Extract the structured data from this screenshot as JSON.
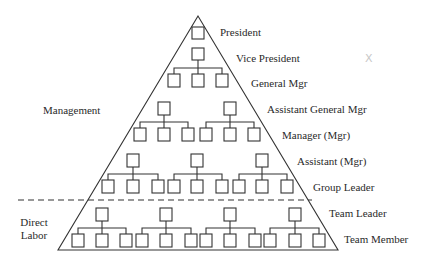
{
  "diagram": {
    "type": "organizational-pyramid",
    "stroke_color": "#333333",
    "levels": [
      {
        "label": "President",
        "boxes": 1
      },
      {
        "label": "Vice President",
        "boxes": 1
      },
      {
        "label": "General Mgr",
        "boxes": 3
      },
      {
        "label": "Assistant General Mgr",
        "boxes": 2
      },
      {
        "label": "Manager (Mgr)",
        "boxes": 6
      },
      {
        "label": "Assistant (Mgr)",
        "boxes": 3
      },
      {
        "label": "Group Leader",
        "boxes": 9
      },
      {
        "label": "Team Leader",
        "boxes": 4
      },
      {
        "label": "Team Member",
        "boxes": 12
      }
    ],
    "sections": {
      "management": "Management",
      "direct_labor_line1": "Direct",
      "direct_labor_line2": "Labor"
    },
    "stray_mark": "X"
  }
}
